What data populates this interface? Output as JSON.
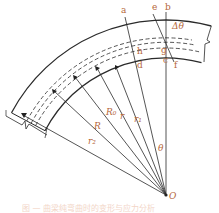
{
  "figure": {
    "type": "curved-beam-geometry",
    "center_label": "O",
    "point_labels": {
      "a": "a",
      "b": "b",
      "c": "c",
      "d": "d",
      "e": "e",
      "f": "f",
      "g": "g",
      "h": "h"
    },
    "angle_labels": {
      "theta": "θ",
      "delta_theta": "Δθ"
    },
    "radius_labels": {
      "r1": "r₁",
      "r": "r",
      "R0": "R₀",
      "R": "R",
      "r2": "r₂"
    },
    "caption": "图 — 曲梁纯弯曲时的变形与应力分析",
    "colors": {
      "line": "#2a2a2a",
      "label": "#b5673a",
      "caption": "#e9b49a"
    }
  }
}
